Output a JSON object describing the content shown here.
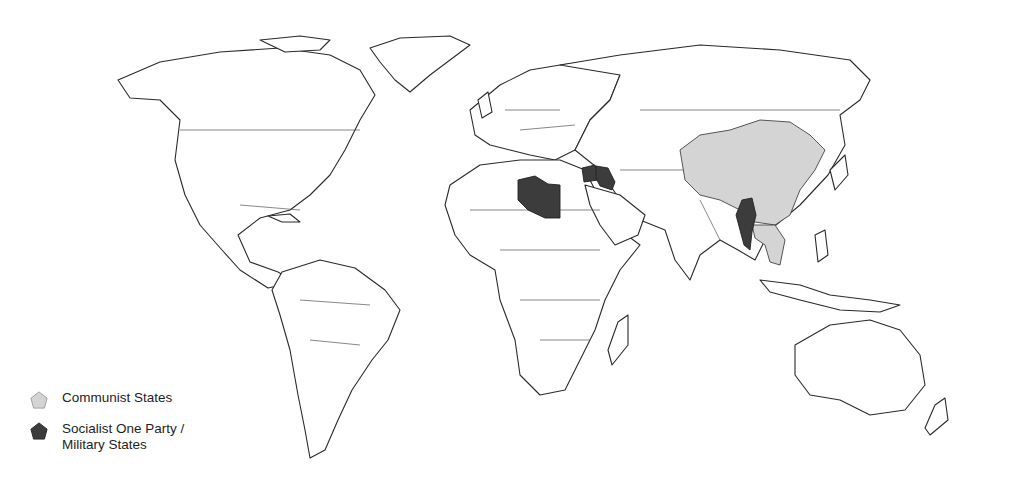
{
  "map": {
    "type": "world political map",
    "colors": {
      "communist": "#d4d4d4",
      "socialist_military": "#3c3c3c",
      "land": "#ffffff",
      "border": "#2a2a2a"
    },
    "highlighted": {
      "communist_states": [
        "China",
        "Laos",
        "Vietnam"
      ],
      "socialist_one_party_military_states": [
        "Libya",
        "Syria",
        "Iraq",
        "Burma"
      ]
    }
  },
  "legend": {
    "items": [
      {
        "label": "Communist States",
        "color": "#d4d4d4",
        "shape": "pentagon"
      },
      {
        "label_line1": "Socialist One Party /",
        "label_line2": "Military States",
        "color": "#3c3c3c",
        "shape": "pentagon"
      }
    ]
  }
}
